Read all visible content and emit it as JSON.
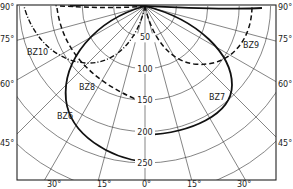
{
  "diagram": {
    "type": "polar-intensity-distribution",
    "origin": {
      "x": 145,
      "y": 6
    },
    "scale_px_per_unit": 0.628,
    "frame": {
      "left": 17,
      "top": 5,
      "right": 276,
      "bottom": 180
    },
    "radial_rings": [
      50,
      100,
      150,
      200,
      250,
      300
    ],
    "radial_labels": [
      "50",
      "100",
      "150",
      "200",
      "250"
    ],
    "angle_rays_deg": [
      5,
      10,
      15,
      20,
      25,
      30,
      35,
      40,
      45,
      50,
      55,
      60,
      65,
      70,
      75,
      80,
      85,
      90
    ],
    "left_angle_labels": [
      {
        "text": "90°",
        "y": 4
      },
      {
        "text": "75°",
        "y": 36
      },
      {
        "text": "60°",
        "y": 81
      },
      {
        "text": "45°",
        "y": 140
      }
    ],
    "right_angle_labels": [
      {
        "text": "90°",
        "y": 4
      },
      {
        "text": "75°",
        "y": 36
      },
      {
        "text": "60°",
        "y": 81
      },
      {
        "text": "45°",
        "y": 140
      }
    ],
    "bottom_angle_labels": [
      {
        "text": "30°",
        "x": 47
      },
      {
        "text": "15°",
        "x": 97
      },
      {
        "text": "0°",
        "x": 142
      },
      {
        "text": "15°",
        "x": 187
      },
      {
        "text": "30°",
        "x": 237
      }
    ],
    "curves": [
      {
        "name": "BZ6",
        "label": "BZ6",
        "style": "solid-thick",
        "label_pos": {
          "x": 57,
          "y": 113
        }
      },
      {
        "name": "BZ7",
        "label": "BZ7",
        "style": "solid-thick",
        "label_pos": {
          "x": 209,
          "y": 94
        }
      },
      {
        "name": "BZ8",
        "label": "BZ8",
        "style": "dashed",
        "label_pos": {
          "x": 79,
          "y": 84
        }
      },
      {
        "name": "BZ9",
        "label": "BZ9",
        "style": "dashed",
        "label_pos": {
          "x": 243,
          "y": 42
        }
      },
      {
        "name": "BZ10",
        "label": "BZ10",
        "style": "dash-dot",
        "label_pos": {
          "x": 27,
          "y": 49
        }
      }
    ]
  }
}
